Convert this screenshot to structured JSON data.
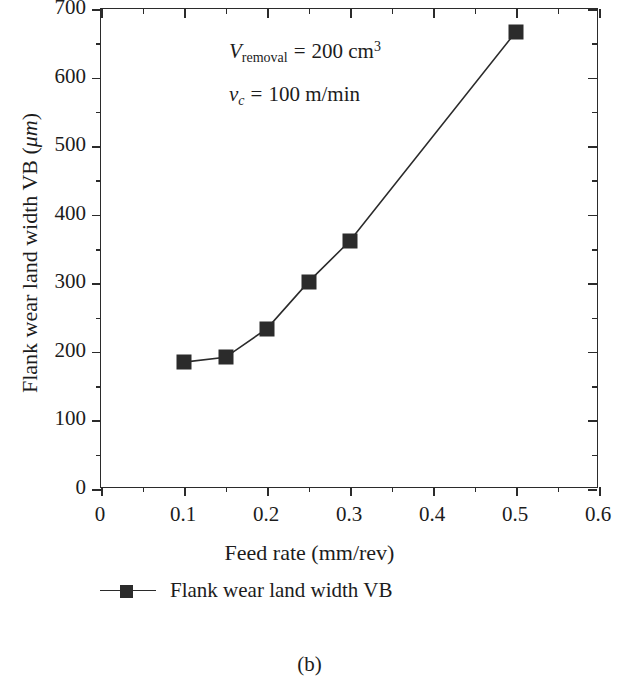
{
  "chart_data": {
    "type": "line",
    "title": "",
    "xlabel": "Feed rate (mm/rev)",
    "ylabel": "Flank wear land width VB (μm)",
    "xlim": [
      0,
      0.6
    ],
    "ylim": [
      0,
      700
    ],
    "x_major_ticks": [
      0,
      0.1,
      0.2,
      0.3,
      0.4,
      0.5,
      0.6
    ],
    "x_tick_labels": [
      "0",
      "0.1",
      "0.2",
      "0.3",
      "0.4",
      "0.5",
      "0.6"
    ],
    "x_minor_step": 0.05,
    "y_major_ticks": [
      0,
      100,
      200,
      300,
      400,
      500,
      600,
      700
    ],
    "y_tick_labels": [
      "0",
      "100",
      "200",
      "300",
      "400",
      "500",
      "600",
      "700"
    ],
    "y_minor_step": 50,
    "grid": false,
    "legend_position": "below-axes-left",
    "series": [
      {
        "name": "Flank wear land width VB",
        "marker": "filled-square",
        "color": "#2b2b2b",
        "x": [
          0.1,
          0.15,
          0.2,
          0.25,
          0.3,
          0.5
        ],
        "values": [
          185,
          192,
          234,
          302,
          362,
          667
        ]
      }
    ],
    "annotations": [
      {
        "id": "removal-volume",
        "text": "V_removal = 200 cm^3",
        "symbol": "V",
        "subscript": "removal",
        "value": "200",
        "unit": "cm",
        "unit_sup": "3"
      },
      {
        "id": "cutting-speed",
        "text": "v_c = 100 m/min",
        "symbol": "v",
        "subscript": "c",
        "value": "100",
        "unit": "m/min",
        "unit_sup": ""
      }
    ]
  },
  "axis": {
    "x_title": "Feed rate (mm/rev)",
    "y_title_main": "Flank wear land width VB (",
    "y_title_mu": "μm",
    "y_title_close": ")"
  },
  "legend": {
    "series_label": "Flank wear land width VB"
  },
  "caption": {
    "text": "(b)"
  },
  "annotation_text": {
    "removal_symbol": "V",
    "removal_sub": "removal",
    "removal_eq": "=",
    "removal_value": "200",
    "removal_unit": "cm",
    "removal_sup": "3",
    "speed_symbol": "v",
    "speed_sub": "c",
    "speed_eq": "=",
    "speed_value": "100",
    "speed_unit": "m/min"
  },
  "colors": {
    "ink": "#2b2b2b",
    "text": "#1c1c1c",
    "background": "#ffffff"
  }
}
